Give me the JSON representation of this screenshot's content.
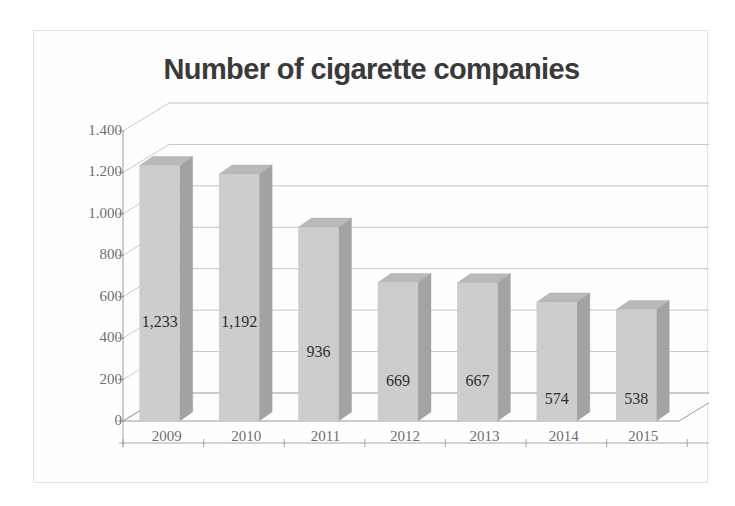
{
  "chart_data": {
    "type": "bar",
    "title": "Number of cigarette companies",
    "xlabel": "",
    "ylabel": "",
    "categories": [
      "2009",
      "2010",
      "2011",
      "2012",
      "2013",
      "2014",
      "2015"
    ],
    "values": [
      1233,
      1192,
      936,
      669,
      667,
      574,
      538
    ],
    "value_labels": [
      "1,233",
      "1,192",
      "936",
      "669",
      "667",
      "574",
      "538"
    ],
    "ylim": [
      0,
      1400
    ],
    "ytick_values": [
      0,
      200,
      400,
      600,
      800,
      1000,
      1200,
      1400
    ],
    "ytick_labels": [
      "0",
      "200",
      "400",
      "600",
      "800",
      "1.000",
      "1.200",
      "1.400"
    ],
    "grid": true,
    "legend": false,
    "style": "3d-column",
    "series": [
      {
        "name": "Number of cigarette companies",
        "values": [
          1233,
          1192,
          936,
          669,
          667,
          574,
          538
        ]
      }
    ],
    "colors": {
      "bar_front": "#cdcdcd",
      "bar_side": "#a3a3a3",
      "bar_top": "#b9b9b9",
      "gridline": "#9a9a9a",
      "axis": "#8a8a8a",
      "floor": "#fdfdfd",
      "title_text": "#3a3a3a",
      "tick_text": "#6e6e6e",
      "value_text": "#2f2f2f",
      "frame": "#e3e3e3",
      "background": "#ffffff"
    }
  }
}
